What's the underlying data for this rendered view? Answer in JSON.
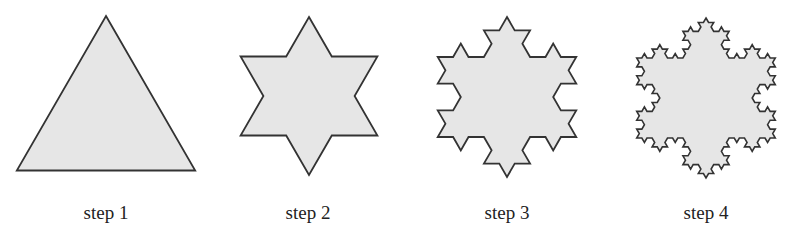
{
  "figure": {
    "fill_color": "#e6e6e6",
    "stroke_color": "#333333",
    "steps": [
      {
        "label": "step 1",
        "iterations": 0,
        "cx": 106,
        "cy": 119,
        "r": 103,
        "label_x": 106
      },
      {
        "label": "step 2",
        "iterations": 1,
        "cx": 309,
        "cy": 96,
        "r": 79,
        "label_x": 308
      },
      {
        "label": "step 3",
        "iterations": 2,
        "cx": 507,
        "cy": 97,
        "r": 80,
        "label_x": 507
      },
      {
        "label": "step 4",
        "iterations": 3,
        "cx": 706,
        "cy": 98,
        "r": 80,
        "label_x": 706
      }
    ]
  }
}
